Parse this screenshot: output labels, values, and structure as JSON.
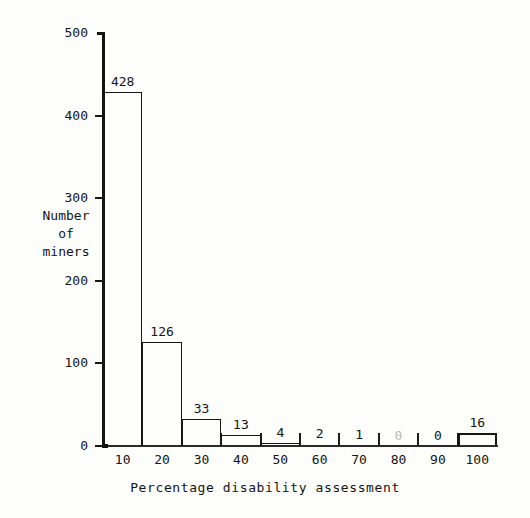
{
  "chart_data": {
    "type": "bar",
    "title": "",
    "subtitle": "",
    "xlabel": "Percentage disability assessment",
    "ylabel": "Number of miners",
    "ylabel_lines": [
      "Number",
      "of",
      "miners"
    ],
    "categories": [
      "10",
      "20",
      "30",
      "40",
      "50",
      "60",
      "70",
      "80",
      "90",
      "100"
    ],
    "bin_edges": [
      5,
      15,
      25,
      35,
      45,
      55,
      65,
      75,
      85,
      95,
      105
    ],
    "values": [
      428,
      126,
      33,
      13,
      4,
      2,
      1,
      0,
      0,
      16
    ],
    "value_labels": [
      "428",
      "126",
      "33",
      "13",
      "4",
      "2",
      "1",
      "0",
      "0",
      "16"
    ],
    "faded_labels": [
      false,
      false,
      false,
      false,
      false,
      false,
      false,
      true,
      false,
      false
    ],
    "ylim": [
      0,
      500
    ],
    "xlim": [
      5,
      105
    ],
    "ytick_values": [
      0,
      100,
      200,
      300,
      400,
      500
    ],
    "ytick_labels": [
      "0",
      "100",
      "200",
      "300",
      "400",
      "500"
    ],
    "grid": false,
    "legend": false,
    "legend_position": "none",
    "bar_style": "outline",
    "emphasized_bars": [
      "100"
    ]
  },
  "colors": {
    "background": "#fdfdfb",
    "ink": "#161616",
    "axis": "#121212",
    "faded_ink": "#b9b9b9"
  }
}
